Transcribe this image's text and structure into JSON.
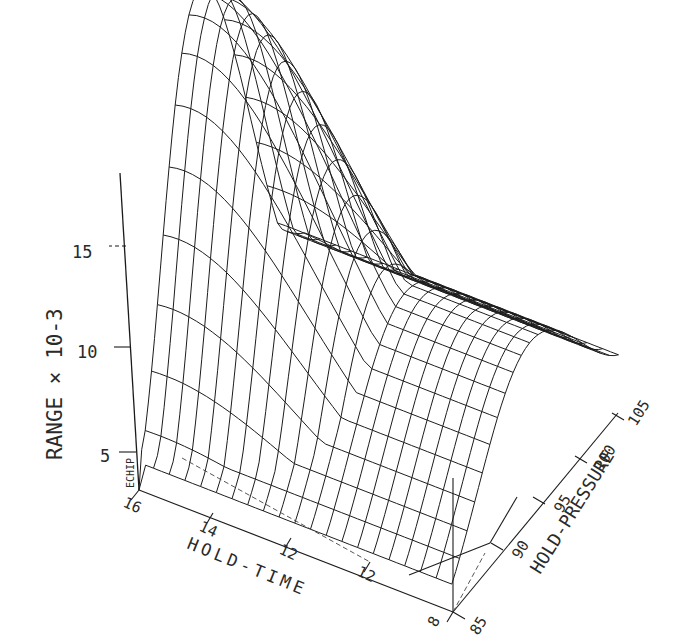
{
  "chart_data": {
    "type": "surface-3d-wireframe",
    "title": "",
    "z_axis": {
      "label": "RANGE × 10Ø-3",
      "label_display": "RANGE × 10-3",
      "ticks": [
        "5",
        "10",
        "15"
      ],
      "tick_values": [
        5,
        10,
        15
      ]
    },
    "x_axis": {
      "label": "HOLD-TIME",
      "ticks": [
        "16",
        "14",
        "12",
        "12",
        "8"
      ],
      "tick_values": [
        16,
        14,
        12,
        10,
        8
      ]
    },
    "y_axis": {
      "label": "HOLD-PRESSURE",
      "ticks": [
        "85",
        "90",
        "95",
        "100",
        "105"
      ],
      "tick_values": [
        85,
        90,
        95,
        100,
        105
      ]
    },
    "watermark": "ECHIP",
    "surface_description": "Saddle/ridge-shaped response surface: RANGE is highest (~19e-3) at high HOLD-TIME (~16) and low-mid HOLD-PRESSURE, dips to a trough (~6e-3) through the middle, and rises again (~8e-3) toward HOLD-PRESSURE 105.",
    "approx_points": [
      {
        "hold_time": 16,
        "hold_pressure": 85,
        "range": 4
      },
      {
        "hold_time": 16,
        "hold_pressure": 95,
        "range": 19
      },
      {
        "hold_time": 16,
        "hold_pressure": 105,
        "range": 14
      },
      {
        "hold_time": 12,
        "hold_pressure": 85,
        "range": 5
      },
      {
        "hold_time": 12,
        "hold_pressure": 95,
        "range": 10
      },
      {
        "hold_time": 12,
        "hold_pressure": 105,
        "range": 8
      },
      {
        "hold_time": 8,
        "hold_pressure": 85,
        "range": 6
      },
      {
        "hold_time": 8,
        "hold_pressure": 95,
        "range": 7
      },
      {
        "hold_time": 8,
        "hold_pressure": 105,
        "range": 8
      }
    ],
    "grid": false,
    "legend": "none"
  },
  "labels": {
    "z_title": "RANGE × 10-3",
    "z_ticks": [
      "5",
      "10",
      "15"
    ],
    "x_title": "HOLD-TIME",
    "x_ticks": [
      "16",
      "14",
      "12",
      "12",
      "8"
    ],
    "y_title": "HOLD-PRESSURE",
    "y_ticks": [
      "85",
      "90",
      "95",
      "100",
      "105"
    ],
    "watermark": "ECHIP"
  }
}
